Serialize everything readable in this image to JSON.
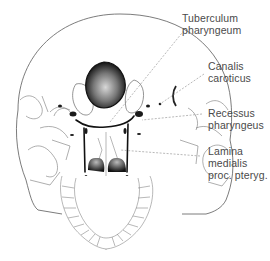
{
  "figure": {
    "colors": {
      "outline": "#555555",
      "dark_fill": "#1a1a1a",
      "label_text": "#4a4a4a",
      "leader_line": "#8a8a8a"
    }
  },
  "labels": [
    {
      "id": "tuberculum",
      "lines": [
        "Tuberculum",
        "pharyngeum"
      ]
    },
    {
      "id": "canalis",
      "lines": [
        "Canalis",
        "caroticus"
      ]
    },
    {
      "id": "recessus",
      "lines": [
        "Recessus",
        "pharyngeus"
      ]
    },
    {
      "id": "lamina",
      "lines": [
        "Lamina",
        "medialis",
        "proc. pteryg."
      ]
    }
  ]
}
